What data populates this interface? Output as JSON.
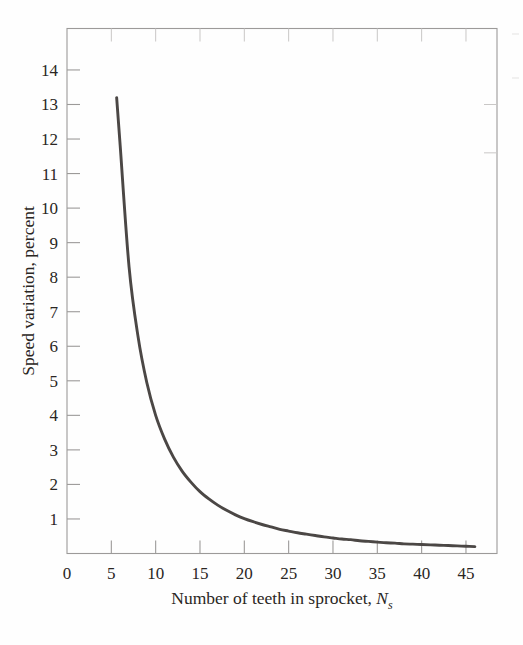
{
  "figure": {
    "background_color": "#fefefe",
    "frame_color": "#9c9a99",
    "curve_color": "#4b4745",
    "text_color": "#2a2623"
  },
  "axes": {
    "x_title_main": "Number of teeth in sprocket,",
    "x_title_symbol": "N",
    "x_title_subscript": "s",
    "y_title": "Speed variation, percent",
    "x_tick_labels": [
      "0",
      "5",
      "10",
      "15",
      "20",
      "25",
      "30",
      "35",
      "40",
      "45"
    ],
    "y_tick_labels": [
      "1",
      "2",
      "3",
      "4",
      "5",
      "6",
      "7",
      "8",
      "9",
      "10",
      "11",
      "12",
      "13",
      "14"
    ]
  },
  "chart_data": {
    "type": "line",
    "title": "",
    "subtitle": "",
    "xlabel": "Number of teeth in sprocket, Ns",
    "ylabel": "Speed variation, percent",
    "xlim": [
      0,
      48.5
    ],
    "ylim": [
      0,
      15.2
    ],
    "xticks": [
      0,
      5,
      10,
      15,
      20,
      25,
      30,
      35,
      40,
      45
    ],
    "yticks": [
      1,
      2,
      3,
      4,
      5,
      6,
      7,
      8,
      9,
      10,
      11,
      12,
      13,
      14
    ],
    "grid": false,
    "legend": null,
    "annotations": [],
    "series": [
      {
        "name": "Chain speed variation",
        "x": [
          5.6,
          6,
          7,
          8,
          9,
          10,
          11,
          12,
          13,
          14,
          15,
          16,
          17,
          18,
          19,
          20,
          21,
          22,
          23,
          24,
          25,
          26,
          27,
          28,
          29,
          30,
          31,
          32,
          33,
          34,
          35,
          36,
          37,
          38,
          39,
          40,
          41,
          42,
          43,
          44,
          45,
          46
        ],
        "y": [
          13.2,
          11.8,
          8.3,
          6.3,
          4.95,
          4.0,
          3.32,
          2.79,
          2.38,
          2.06,
          1.79,
          1.58,
          1.4,
          1.25,
          1.12,
          1.01,
          0.92,
          0.84,
          0.77,
          0.7,
          0.65,
          0.6,
          0.56,
          0.52,
          0.48,
          0.45,
          0.42,
          0.4,
          0.37,
          0.35,
          0.33,
          0.31,
          0.3,
          0.28,
          0.27,
          0.26,
          0.25,
          0.24,
          0.23,
          0.22,
          0.21,
          0.2
        ]
      }
    ]
  }
}
